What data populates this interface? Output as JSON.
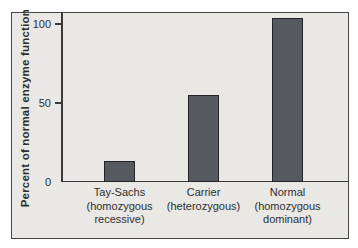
{
  "chart_data": {
    "type": "bar",
    "title": "",
    "ylabel": "Percent of normal enzyme function",
    "xlabel": "",
    "categories": [
      "Tay-Sachs\n(homozygous\nrecessive)",
      "Carrier\n(heterozygous)",
      "Normal\n(homozygous\ndominant)"
    ],
    "values": [
      13,
      55,
      104
    ],
    "yticks": [
      0,
      50,
      100
    ],
    "ylim": [
      0,
      107
    ],
    "grid": false,
    "legend": false,
    "colors": {
      "bar_fill": "#56595d",
      "bar_border": "#242428",
      "plot_background": "#e9e8e5",
      "figure_border": "#454545",
      "axis": "#3a3a3a",
      "text": "#2e2e2e",
      "page_background": "#ffffff"
    }
  }
}
